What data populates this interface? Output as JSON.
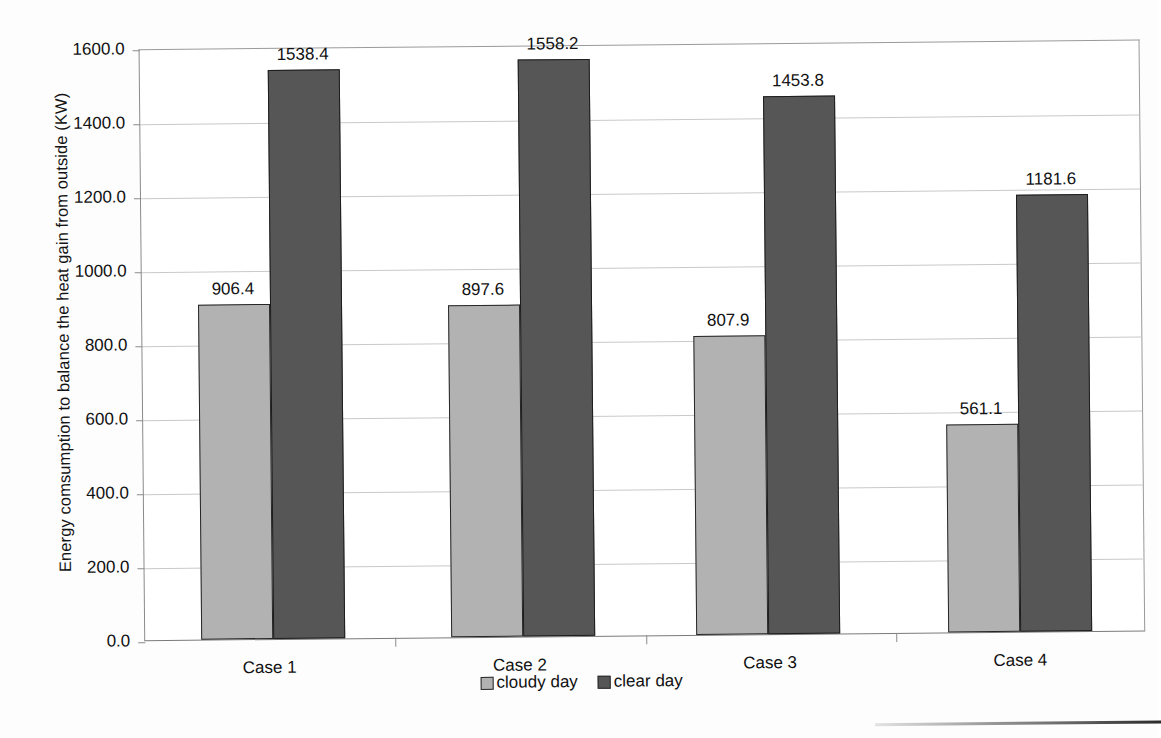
{
  "chart_data": {
    "type": "bar",
    "title": "",
    "subtitle": "",
    "xlabel": "",
    "ylabel": "Energy comsumption to balance the heat gain from outside (KW)",
    "categories": [
      "Case 1",
      "Case 2",
      "Case 3",
      "Case 4"
    ],
    "series": [
      {
        "name": "cloudy day",
        "color": "#b2b2b2",
        "values": [
          906.4,
          897.6,
          807.9,
          561.1
        ],
        "labels": [
          "906.4",
          "897.6",
          "807.9",
          "561.1"
        ]
      },
      {
        "name": "clear day",
        "color": "#565656",
        "values": [
          1538.4,
          1558.2,
          1453.8,
          1181.6
        ],
        "labels": [
          "1538.4",
          "1558.2",
          "1453.8",
          "1181.6"
        ]
      }
    ],
    "ylim": [
      0,
      1600
    ],
    "ytick_values": [
      0,
      200,
      400,
      600,
      800,
      1000,
      1200,
      1400,
      1600
    ],
    "ytick_labels": [
      "0.0",
      "200.0",
      "400.0",
      "600.0",
      "800.0",
      "1000.0",
      "1200.0",
      "1400.0",
      "1600.0"
    ],
    "grid": true,
    "grid_axis": "y",
    "legend_position": "bottom",
    "data_labels": true
  },
  "legend": {
    "entries": [
      {
        "label": "cloudy day",
        "swatch": "cloudy"
      },
      {
        "label": "clear day",
        "swatch": "clear"
      }
    ]
  }
}
